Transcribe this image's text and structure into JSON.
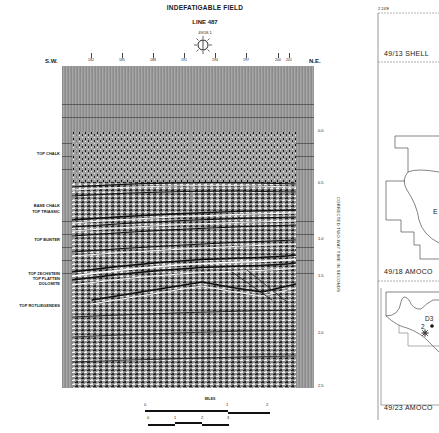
{
  "header": {
    "title": "INDEFATIGABLE FIELD",
    "line": "LINE 487",
    "well": "49/18-1"
  },
  "orientation": {
    "left": "S.W.",
    "right": "N.E."
  },
  "shotpoints": [
    "182",
    "185",
    "188",
    "191",
    "194",
    "197",
    "200",
    "201"
  ],
  "time_axis": {
    "label": "CORRECTED TWO-WAY TIME IN SECONDS",
    "ticks": [
      "0.0",
      "0.5",
      "1.0",
      "1.5",
      "2.0",
      "2.5"
    ]
  },
  "horizons": [
    {
      "name": "TOP CHALK"
    },
    {
      "name": "BASE CHALK"
    },
    {
      "name": "TOP TRIASSIC"
    },
    {
      "name": "TOP BUNTER"
    },
    {
      "name": "TOP ZECHSTEIN"
    },
    {
      "name": "TOP PLATTEN"
    },
    {
      "name": "DOLOMITE"
    },
    {
      "name": "TOP ROTLIEGENDES"
    }
  ],
  "scale_bar": {
    "title": "MILES",
    "miles_ticks": [
      "0",
      "1",
      "2"
    ],
    "km_ticks": [
      "0",
      "1",
      "2",
      "3"
    ]
  },
  "map": {
    "coordinate": "2 24'E",
    "blocks": [
      "49/13 SHELL",
      "49/18 AMOCO",
      "49/23 AMOCO"
    ],
    "well_labels": [
      "D3",
      "2"
    ],
    "field_letter": "E"
  },
  "colors": {
    "background": "#ffffff",
    "ink": "#1a1a1a",
    "section_grey": "#9a9a9a"
  }
}
